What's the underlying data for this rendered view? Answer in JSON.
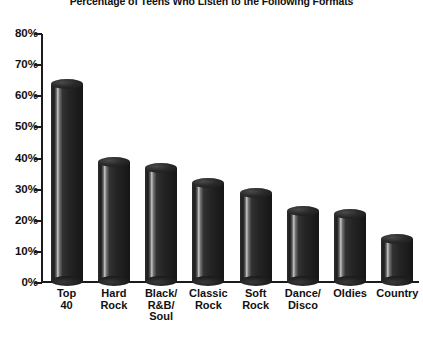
{
  "chart_data": {
    "type": "bar",
    "title": "Percentage of Teens Who Listen to the Following Formats",
    "xlabel": "",
    "ylabel": "",
    "categories": [
      "Top\n40",
      "Hard\nRock",
      "Black/\nR&B/\nSoul",
      "Classic\nRock",
      "Soft\nRock",
      "Dance/\nDisco",
      "Oldies",
      "Country"
    ],
    "values": [
      65,
      40,
      38,
      33,
      30,
      24,
      23,
      15
    ],
    "ylim": [
      0,
      80
    ],
    "ytick_values": [
      0,
      10,
      20,
      30,
      40,
      50,
      60,
      70,
      80
    ],
    "ytick_labels": [
      "0%",
      "10%",
      "20%",
      "30%",
      "40%",
      "50%",
      "60%",
      "70%",
      "80%"
    ],
    "grid": false,
    "legend": "none",
    "bar_style": "3d-cylinder",
    "colors": {
      "bar_fill": "#222222",
      "bar_highlight": "#c9c9c9",
      "axis": "#1b1b1b",
      "text": "#111111",
      "background": "#ffffff"
    }
  }
}
